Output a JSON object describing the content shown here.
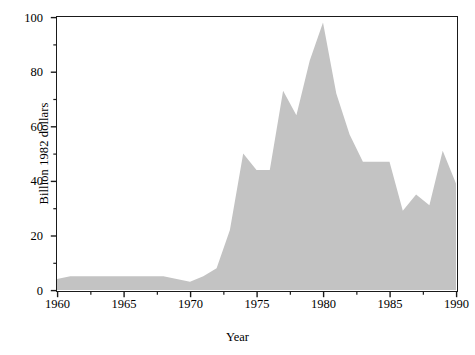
{
  "chart_data": {
    "type": "area",
    "title": "",
    "xlabel": "Year",
    "ylabel": "Billion 1982 dollars",
    "xlim": [
      1960,
      1990
    ],
    "ylim": [
      0,
      100
    ],
    "grid": false,
    "legend": "none",
    "series_color": "#c3c3c3",
    "axis_color": "#1a1a1a",
    "x_major_ticks": [
      1960,
      1965,
      1970,
      1975,
      1980,
      1985,
      1990
    ],
    "x_major_tick_labels": [
      "1960",
      "1965",
      "1970",
      "1975",
      "1980",
      "1985",
      "1990"
    ],
    "x_minor_ticks": [
      1962.5,
      1967.5,
      1972.5,
      1977.5,
      1982.5,
      1987.5
    ],
    "y_major_ticks": [
      0,
      20,
      40,
      60,
      80,
      100
    ],
    "y_major_tick_labels": [
      "0",
      "20",
      "40",
      "60",
      "80",
      "100"
    ],
    "y_minor_ticks": [
      10,
      30,
      50,
      70,
      90
    ],
    "x": [
      1960,
      1961,
      1962,
      1963,
      1964,
      1965,
      1966,
      1967,
      1968,
      1969,
      1970,
      1971,
      1972,
      1973,
      1974,
      1975,
      1976,
      1977,
      1978,
      1979,
      1980,
      1981,
      1982,
      1983,
      1984,
      1985,
      1986,
      1987,
      1988,
      1989,
      1990
    ],
    "values": [
      4,
      5,
      5,
      5,
      5,
      5,
      5,
      5,
      5,
      4,
      3,
      5,
      8,
      22,
      50,
      44,
      44,
      73,
      64,
      84,
      98,
      72,
      57,
      47,
      47,
      47,
      29,
      35,
      31,
      51,
      39
    ],
    "series": [
      {
        "name": "Billion 1982 dollars",
        "values": [
          4,
          5,
          5,
          5,
          5,
          5,
          5,
          5,
          5,
          4,
          3,
          5,
          8,
          22,
          50,
          44,
          44,
          73,
          64,
          84,
          98,
          72,
          57,
          47,
          47,
          47,
          29,
          35,
          31,
          51,
          39
        ]
      }
    ]
  },
  "axes": {
    "x_title": "Year",
    "y_title": "Billion 1982 dollars"
  }
}
